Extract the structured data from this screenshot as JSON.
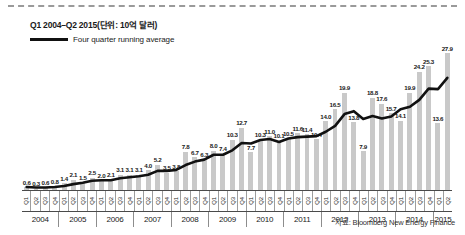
{
  "title": "Q1 2004–Q2 2015(단위: 10억 달러)",
  "legend": {
    "label": "Four quarter running average",
    "swatch": "line-swatch"
  },
  "source": "자료: Bloomberg New Energy Finance",
  "colors": {
    "bar": "#c9c9c9",
    "line": "#111111",
    "axis": "#4a4a4a",
    "text": "#1a1a1a"
  },
  "chart_data": {
    "type": "bar",
    "title": "Q1 2004–Q2 2015(단위: 10억 달러)",
    "xlabel": "",
    "ylabel": "10억 달러",
    "ylim": [
      0,
      29
    ],
    "grid": false,
    "legend_position": "top-left",
    "categories": [
      "Q1 2004",
      "Q2 2004",
      "Q3 2004",
      "Q4 2004",
      "Q1 2005",
      "Q2 2005",
      "Q3 2005",
      "Q4 2005",
      "Q1 2006",
      "Q2 2006",
      "Q3 2006",
      "Q4 2006",
      "Q1 2007",
      "Q2 2007",
      "Q3 2007",
      "Q4 2007",
      "Q1 2008",
      "Q2 2008",
      "Q3 2008",
      "Q4 2008",
      "Q1 2009",
      "Q2 2009",
      "Q3 2009",
      "Q4 2009",
      "Q1 2010",
      "Q2 2010",
      "Q3 2010",
      "Q4 2010",
      "Q1 2011",
      "Q2 2011",
      "Q3 2011",
      "Q4 2011",
      "Q1 2012",
      "Q2 2012",
      "Q3 2012",
      "Q4 2012",
      "Q1 2013",
      "Q2 2013",
      "Q3 2013",
      "Q4 2013",
      "Q1 2014",
      "Q2 2014",
      "Q3 2014",
      "Q4 2014",
      "Q1 2015",
      "Q2 2015"
    ],
    "values": [
      0.6,
      0.3,
      0.6,
      0.8,
      1.4,
      2.1,
      1.5,
      2.5,
      2.0,
      2.1,
      3.1,
      3.1,
      3.1,
      4.0,
      5.2,
      3.5,
      3.8,
      7.8,
      6.7,
      6.3,
      8.0,
      7.4,
      10.3,
      12.7,
      7.7,
      10.3,
      11.0,
      10.1,
      10.5,
      11.6,
      11.4,
      10.4,
      14.0,
      16.5,
      19.9,
      13.8,
      7.9,
      18.8,
      17.6,
      15.7,
      14.1,
      19.9,
      24.2,
      25.3,
      13.6,
      27.9
    ],
    "value_labels": [
      "0.6",
      "0.3",
      "0.6",
      "0.8",
      "1.4",
      "2.1",
      "1.5",
      "2.5",
      "2.0",
      "2.1",
      "3.1",
      "3.1",
      "3.1",
      "4.0",
      "5.2",
      "3.5",
      "3.8",
      "7.8",
      "6.7",
      "6.3",
      "8.0",
      "7.4",
      "10.3",
      "12.7",
      "7.7",
      "10.3",
      "11.0",
      "10.1",
      "10.5",
      "11.6",
      "11.4",
      "10.4",
      "14.0",
      "16.5",
      "19.9",
      "13.8",
      "7.9",
      "18.8",
      "17.6",
      "15.7",
      "14.1",
      "19.9",
      "24.2",
      "25.3",
      "13.6",
      "27.9"
    ],
    "series": [
      {
        "name": "Four quarter running average",
        "type": "line",
        "values": [
          0.6,
          0.5,
          0.5,
          0.6,
          0.8,
          1.2,
          1.5,
          1.9,
          2.0,
          2.0,
          2.4,
          2.6,
          2.8,
          3.1,
          3.9,
          3.9,
          4.1,
          5.1,
          5.8,
          6.2,
          7.2,
          7.2,
          8.1,
          9.6,
          9.5,
          10.2,
          10.4,
          9.8,
          10.5,
          10.8,
          10.9,
          11.0,
          11.9,
          13.1,
          15.5,
          16.1,
          14.5,
          15.1,
          14.6,
          15.0,
          16.5,
          17.0,
          18.4,
          20.7,
          20.6,
          22.9
        ]
      }
    ],
    "quarter_tick_labels": [
      "Q1",
      "Q2",
      "Q3",
      "Q4",
      "Q1",
      "Q2",
      "Q3",
      "Q4",
      "Q1",
      "Q2",
      "Q3",
      "Q4",
      "Q1",
      "Q2",
      "Q3",
      "Q4",
      "Q1",
      "Q2",
      "Q3",
      "Q4",
      "Q1",
      "Q2",
      "Q3",
      "Q4",
      "Q1",
      "Q2",
      "Q3",
      "Q4",
      "Q1",
      "Q2",
      "Q3",
      "Q4",
      "Q1",
      "Q2",
      "Q3",
      "Q4",
      "Q1",
      "Q2",
      "Q3",
      "Q4",
      "Q1",
      "Q2",
      "Q3",
      "Q4",
      "Q1",
      "Q2"
    ],
    "year_groups": [
      {
        "year": "2004",
        "quarters": 4
      },
      {
        "year": "2005",
        "quarters": 4
      },
      {
        "year": "2006",
        "quarters": 4
      },
      {
        "year": "2007",
        "quarters": 4
      },
      {
        "year": "2008",
        "quarters": 4
      },
      {
        "year": "2009",
        "quarters": 4
      },
      {
        "year": "2010",
        "quarters": 4
      },
      {
        "year": "2011",
        "quarters": 4
      },
      {
        "year": "2012",
        "quarters": 4
      },
      {
        "year": "2013",
        "quarters": 4
      },
      {
        "year": "2014",
        "quarters": 4
      },
      {
        "year": "2015",
        "quarters": 2
      }
    ]
  }
}
